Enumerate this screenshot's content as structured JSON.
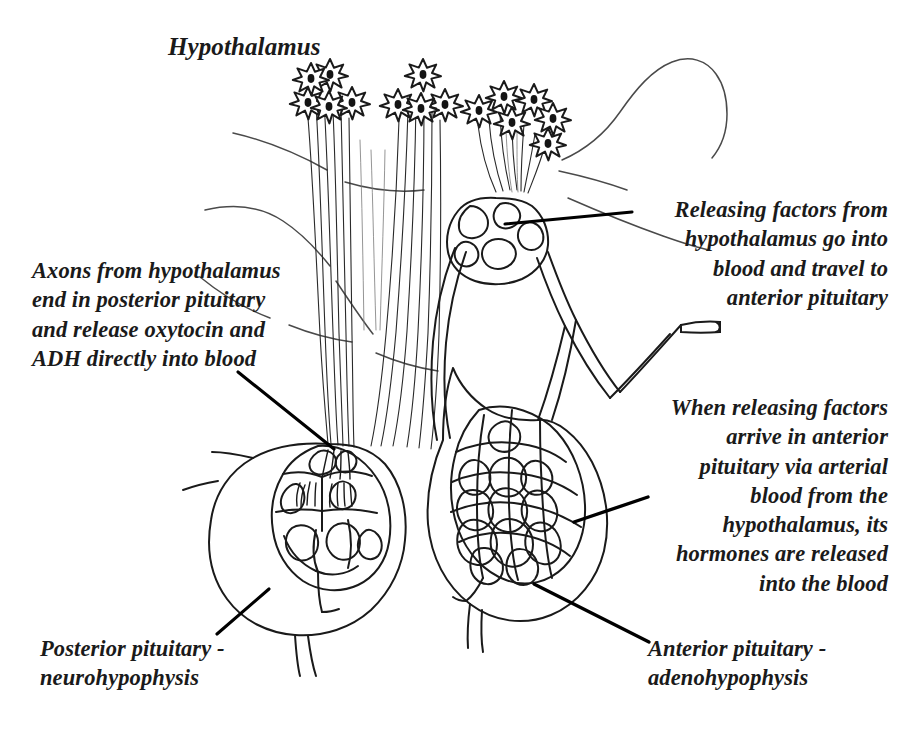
{
  "diagram": {
    "title_label": "Hypothalamus",
    "style": "black-and-white-line-drawing",
    "colors": {
      "background": "#ffffff",
      "ink": "#1a1a1a",
      "faint_ink": "#555555",
      "leader_line": "#000000"
    },
    "labels": [
      {
        "id": "hypothalamus",
        "text": "Hypothalamus",
        "align": "left",
        "has_leader": false
      },
      {
        "id": "axons",
        "text": "Axons from hypothalamus\nend in posterior pituitary\nand release oxytocin and\nADH directly into blood",
        "align": "left",
        "has_leader": true
      },
      {
        "id": "releasing-factors",
        "text": "Releasing factors from\nhypothalamus go into\nblood and travel to\nanterior pituitary",
        "align": "right",
        "has_leader": true
      },
      {
        "id": "when-releasing-factors",
        "text": "When releasing factors\narrive in anterior\npituitary via arterial\nblood from the\nhypothalamus, its\nhormones are released\ninto the blood",
        "align": "right",
        "has_leader": true
      },
      {
        "id": "posterior-pituitary",
        "text": "Posterior pituitary -\nneurohypophysis",
        "align": "left",
        "has_leader": true
      },
      {
        "id": "anterior-pituitary",
        "text": "Anterior pituitary -\nadenohypophysis",
        "align": "left",
        "has_leader": true
      }
    ],
    "structures": [
      {
        "id": "neuron-cluster-left",
        "name": "hypothalamic neuron cell bodies (left cluster)",
        "neuron_count": 5
      },
      {
        "id": "neuron-cluster-middle",
        "name": "hypothalamic neuron cell bodies (middle cluster)",
        "neuron_count": 4
      },
      {
        "id": "neuron-cluster-right",
        "name": "hypothalamic neuron cell bodies (right cluster)",
        "neuron_count": 6
      },
      {
        "id": "axon-bundle",
        "name": "axon bundle descending to posterior pituitary"
      },
      {
        "id": "median-eminence-plexus",
        "name": "primary capillary plexus at median eminence"
      },
      {
        "id": "portal-vessels",
        "name": "hypophyseal portal vessels"
      },
      {
        "id": "arterial-stub",
        "name": "cut arterial branch"
      },
      {
        "id": "posterior-lobe",
        "name": "posterior pituitary (neurohypophysis) with capillary bed"
      },
      {
        "id": "anterior-lobe",
        "name": "anterior pituitary (adenohypophysis) with sinusoid network"
      },
      {
        "id": "brain-contours",
        "name": "faint brain tissue contour lines"
      }
    ]
  }
}
